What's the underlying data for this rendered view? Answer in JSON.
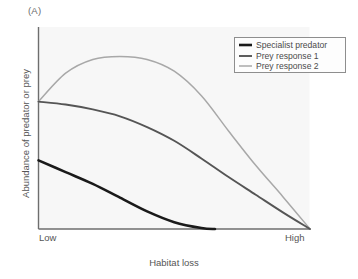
{
  "panel": {
    "label": "(A)"
  },
  "axes": {
    "ylabel": "Abundance of predator or prey",
    "xlabel": "Habitat loss",
    "xtick_low": "Low",
    "xtick_high": "High"
  },
  "legend": {
    "entries": [
      {
        "label": "Specialist predator",
        "color": "#1a1a1a",
        "width": 2.6
      },
      {
        "label": "Prey response 1",
        "color": "#555555",
        "width": 1.9
      },
      {
        "label": "Prey response 2",
        "color": "#a8a8a8",
        "width": 1.5
      }
    ]
  },
  "colors": {
    "plot_background": "#f7f7f7",
    "axis_line": "#6e6e6e",
    "specialist_predator": "#1a1a1a",
    "prey_response_1": "#555555",
    "prey_response_2": "#a8a8a8",
    "text": "#555555"
  },
  "chart_data": {
    "type": "line",
    "title": "(A)",
    "xlabel": "Habitat loss",
    "ylabel": "Abundance of predator or prey",
    "xlim": [
      0,
      1
    ],
    "ylim": [
      0,
      1
    ],
    "xticks": [
      0,
      1
    ],
    "xticklabels": [
      "Low",
      "High"
    ],
    "yticks": [],
    "yticklabels": [],
    "grid": false,
    "legend_position": "upper right",
    "series": [
      {
        "name": "Specialist predator",
        "color": "#1a1a1a",
        "x": [
          0.0,
          0.1,
          0.2,
          0.3,
          0.4,
          0.5,
          0.6,
          0.65
        ],
        "y": [
          0.35,
          0.29,
          0.23,
          0.16,
          0.09,
          0.035,
          0.005,
          0.0
        ]
      },
      {
        "name": "Prey response 1",
        "color": "#555555",
        "x": [
          0.0,
          0.1,
          0.2,
          0.3,
          0.4,
          0.5,
          0.6,
          0.7,
          0.8,
          0.9,
          1.0
        ],
        "y": [
          0.65,
          0.635,
          0.61,
          0.575,
          0.52,
          0.45,
          0.36,
          0.265,
          0.175,
          0.085,
          0.0
        ]
      },
      {
        "name": "Prey response 2",
        "color": "#a8a8a8",
        "x": [
          0.0,
          0.1,
          0.2,
          0.3,
          0.4,
          0.5,
          0.6,
          0.7,
          0.8,
          0.9,
          1.0
        ],
        "y": [
          0.65,
          0.795,
          0.865,
          0.88,
          0.865,
          0.805,
          0.68,
          0.5,
          0.325,
          0.165,
          0.0
        ]
      }
    ]
  }
}
